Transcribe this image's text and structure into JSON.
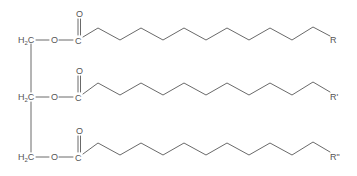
{
  "diagram": {
    "type": "chemical-structure",
    "colors": {
      "bond": "#6a6a6a",
      "label": "#555555",
      "background": "#ffffff"
    },
    "backbone": {
      "carbons": [
        {
          "label": "H",
          "sub": "2",
          "tail": "C"
        },
        {
          "label": "H",
          "sub": "2",
          "tail": "C"
        },
        {
          "label": "H",
          "sub": "2",
          "tail": "C"
        }
      ]
    },
    "chains": [
      {
        "ester_oxygen": "O",
        "carbonyl_carbon": "C",
        "carbonyl_oxygen": "O",
        "terminal_group": "R"
      },
      {
        "ester_oxygen": "O",
        "carbonyl_carbon": "C",
        "carbonyl_oxygen": "O",
        "terminal_group": "R'"
      },
      {
        "ester_oxygen": "O",
        "carbonyl_carbon": "C",
        "carbonyl_oxygen": "O",
        "terminal_group": "R\""
      }
    ]
  }
}
